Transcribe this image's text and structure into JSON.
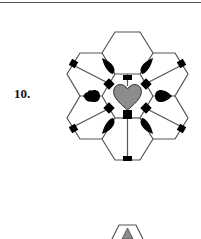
{
  "problem": {
    "number_label": "10."
  },
  "figure": {
    "center_heart_color": "#8c8c8c",
    "petal_heart_color": "#000000",
    "node_color": "#000000",
    "line_color": "#555555"
  },
  "next_figure": {
    "description": "Partial trapezoid shape with gray triangle at bottom edge",
    "triangle_color": "#8c8c8c"
  }
}
